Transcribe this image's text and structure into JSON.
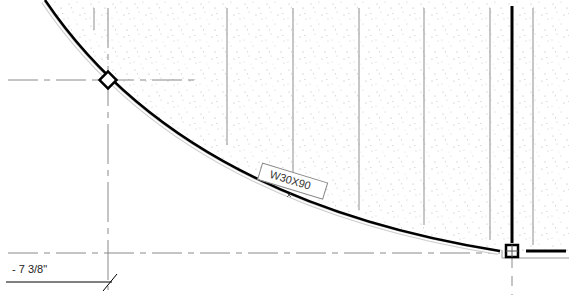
{
  "view": {
    "type": "structural-plan",
    "background": "#ffffff",
    "fill_pattern": "sand-stipple",
    "colors": {
      "beam_line": "#000000",
      "grid_line": "#999999",
      "joist_line": "#9a9a9a",
      "stipple": "#b0b0b0"
    }
  },
  "beam_tag": {
    "label": "W30X90",
    "rotation_deg": 17
  },
  "dimension": {
    "label": "- 7 3/8\""
  },
  "connection_markers": [
    {
      "name": "diamond-column-marker",
      "x": 108,
      "y": 80
    },
    {
      "name": "square-column-marker",
      "x": 512,
      "y": 251
    }
  ]
}
